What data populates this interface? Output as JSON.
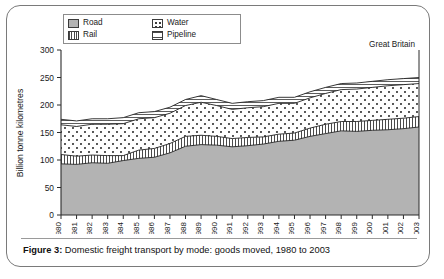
{
  "figure": {
    "caption_prefix": "Figure 3:",
    "caption_text": "Domestic freight transport by mode: goods moved, 1980 to 2003",
    "region_note": "Great Britain"
  },
  "legend": {
    "items": [
      {
        "label": "Road",
        "swatch": "solid-gray-swatch",
        "color": "#b4b4b4"
      },
      {
        "label": "Water",
        "swatch": "dotted-speckle-swatch",
        "color": "#ffffff"
      },
      {
        "label": "Rail",
        "swatch": "vertical-lines-swatch",
        "color": "#ffffff"
      },
      {
        "label": "Pipeline",
        "swatch": "horizontal-lines-swatch",
        "color": "#ffffff"
      }
    ]
  },
  "chart_data": {
    "type": "area",
    "stacked": true,
    "title": "Domestic freight transport by mode: goods moved, 1980 to 2003",
    "subtitle": "Great Britain",
    "xlabel": "",
    "ylabel": "Billion tonne kilometres",
    "ylim": [
      0,
      300
    ],
    "yticks": [
      0,
      50,
      100,
      150,
      200,
      250,
      300
    ],
    "grid": false,
    "legend_position": "top-left",
    "categories": [
      "1980",
      "1981",
      "1982",
      "1983",
      "1984",
      "1985",
      "1986",
      "1987",
      "1988",
      "1989",
      "1990",
      "1991",
      "1992",
      "1993",
      "1994",
      "1995",
      "1996",
      "1997",
      "1998",
      "1999",
      "2000",
      "2001",
      "2002",
      "2003"
    ],
    "series": [
      {
        "name": "Road",
        "fill": "solid-gray",
        "values": [
          93,
          92,
          95,
          94,
          99,
          103,
          105,
          113,
          125,
          128,
          127,
          124,
          126,
          129,
          134,
          136,
          143,
          148,
          153,
          152,
          154,
          155,
          157,
          160
        ]
      },
      {
        "name": "Rail",
        "fill": "vertical-lines",
        "values": [
          17,
          15,
          14,
          14,
          9,
          15,
          16,
          17,
          18,
          17,
          16,
          15,
          15,
          13,
          13,
          13,
          15,
          17,
          17,
          18,
          18,
          19,
          19,
          19
        ]
      },
      {
        "name": "Water",
        "fill": "dotted-speckle",
        "values": [
          54,
          54,
          56,
          57,
          58,
          57,
          56,
          55,
          56,
          60,
          56,
          53,
          54,
          55,
          56,
          54,
          55,
          56,
          58,
          59,
          60,
          61,
          61,
          60
        ]
      },
      {
        "name": "Pipeline",
        "fill": "horizontal-lines",
        "values": [
          10,
          10,
          10,
          10,
          11,
          11,
          11,
          11,
          11,
          12,
          11,
          11,
          11,
          11,
          11,
          11,
          11,
          11,
          11,
          11,
          11,
          11,
          11,
          11
        ]
      }
    ],
    "totals": [
      174,
      171,
      175,
      175,
      177,
      186,
      188,
      196,
      210,
      217,
      210,
      203,
      206,
      208,
      214,
      214,
      224,
      232,
      239,
      240,
      243,
      246,
      248,
      250
    ]
  }
}
